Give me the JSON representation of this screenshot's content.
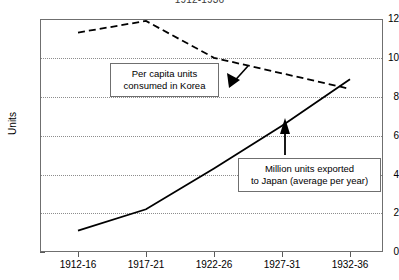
{
  "chart_data": {
    "type": "line",
    "title": "1912-1936",
    "xlabel": "",
    "ylabel": "Units",
    "categories": [
      "1912-16",
      "1917-21",
      "1922-26",
      "1927-31",
      "1932-36"
    ],
    "ylim": [
      0,
      12
    ],
    "yticks": [
      0,
      2,
      4,
      6,
      8,
      10,
      12
    ],
    "grid": true,
    "legend_position": "none",
    "series": [
      {
        "name": "Per capita units consumed in Korea",
        "style": "dashed",
        "color": "#000000",
        "values": [
          11.3,
          11.9,
          10.0,
          9.2,
          8.4
        ]
      },
      {
        "name": "Million units exported to Japan (average per year)",
        "style": "solid",
        "color": "#000000",
        "values": [
          1.1,
          2.2,
          4.3,
          6.5,
          8.9
        ]
      }
    ],
    "annotations": [
      {
        "id": "callout-korea",
        "text": "Per capita units\nconsumed in Korea",
        "arrow": "up-right",
        "points_to": "Per capita units consumed in Korea"
      },
      {
        "id": "callout-japan",
        "text": "Million units exported\nto Japan (average per year)",
        "arrow": "up",
        "points_to": "Million units exported to Japan (average per year)"
      }
    ]
  },
  "yticks": {
    "t0": "0",
    "t1": "2",
    "t2": "4",
    "t3": "6",
    "t4": "8",
    "t5": "10",
    "t6": "12"
  },
  "xticks": {
    "t0": "1912-16",
    "t1": "1917-21",
    "t2": "1922-26",
    "t3": "1927-31",
    "t4": "1932-36"
  },
  "axis": {
    "ylabel": "Units"
  },
  "title": {
    "text": "1912-1936"
  },
  "callouts": {
    "korea": "Per capita units\nconsumed in Korea",
    "japan": "Million units exported\nto Japan (average per year)"
  }
}
